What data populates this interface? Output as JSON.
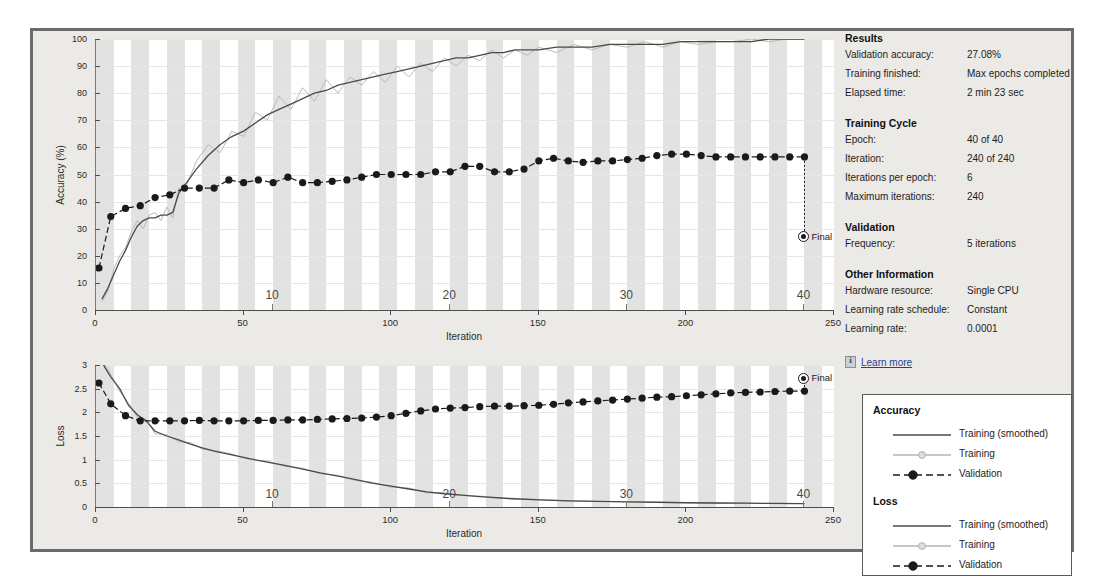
{
  "results": {
    "heading": "Results",
    "rows": [
      {
        "key": "Validation accuracy:",
        "value": "27.08%"
      },
      {
        "key": "Training finished:",
        "value": "Max epochs completed"
      },
      {
        "key": "Elapsed time:",
        "value": "2 min 23 sec"
      }
    ]
  },
  "training_cycle": {
    "heading": "Training Cycle",
    "rows": [
      {
        "key": "Epoch:",
        "value": "40 of 40"
      },
      {
        "key": "Iteration:",
        "value": "240 of 240"
      },
      {
        "key": "Iterations per epoch:",
        "value": "6"
      },
      {
        "key": "Maximum iterations:",
        "value": "240"
      }
    ]
  },
  "validation": {
    "heading": "Validation",
    "rows": [
      {
        "key": "Frequency:",
        "value": "5 iterations"
      }
    ]
  },
  "other_information": {
    "heading": "Other Information",
    "rows": [
      {
        "key": "Hardware resource:",
        "value": "Single CPU"
      },
      {
        "key": "Learning rate schedule:",
        "value": "Constant"
      },
      {
        "key": "Learning rate:",
        "value": "0.0001"
      }
    ]
  },
  "learn_more": {
    "label": "Learn more",
    "icon": "info-icon"
  },
  "legend": {
    "groups": [
      {
        "title": "Accuracy",
        "entries": [
          {
            "label": "Training (smoothed)",
            "style": "solid-dark"
          },
          {
            "label": "Training",
            "style": "solid-light-marker"
          },
          {
            "label": "Validation",
            "style": "dashed-dark-marker"
          }
        ]
      },
      {
        "title": "Loss",
        "entries": [
          {
            "label": "Training (smoothed)",
            "style": "solid-dark"
          },
          {
            "label": "Training",
            "style": "solid-light-marker"
          },
          {
            "label": "Validation",
            "style": "dashed-dark-marker"
          }
        ]
      }
    ]
  },
  "colors": {
    "smoothed": "#4a4a4a",
    "raw": "#b4b4b4",
    "validation": "#1a1a1a",
    "band": "#e2e2e2",
    "frame": "#6b6b6b",
    "panel_bg": "#eceae6",
    "link": "#25438c"
  },
  "chart_data": [
    {
      "type": "line",
      "id": "accuracy",
      "title": "",
      "xlabel": "Iteration",
      "ylabel": "Accuracy (%)",
      "xlim": [
        0,
        250
      ],
      "ylim": [
        0,
        100
      ],
      "xticks": [
        0,
        50,
        100,
        150,
        200,
        250
      ],
      "yticks": [
        0,
        10,
        20,
        30,
        40,
        50,
        60,
        70,
        80,
        90,
        100
      ],
      "epoch_ticks": [
        10,
        20,
        30,
        40
      ],
      "iterations_per_epoch": 6,
      "grid": true,
      "legend_position": "external-bottom-right",
      "final_point": {
        "x": 240,
        "y": 27.08,
        "label": "Final"
      },
      "series": [
        {
          "name": "Training (smoothed)",
          "style": "solid-dark",
          "x": [
            2,
            4,
            6,
            8,
            10,
            12,
            14,
            16,
            18,
            20,
            22,
            24,
            26,
            28,
            30,
            34,
            38,
            42,
            46,
            50,
            54,
            58,
            62,
            66,
            70,
            74,
            78,
            82,
            86,
            90,
            94,
            98,
            102,
            106,
            110,
            114,
            118,
            122,
            126,
            130,
            134,
            138,
            142,
            146,
            150,
            156,
            162,
            168,
            174,
            180,
            186,
            192,
            198,
            204,
            210,
            216,
            222,
            228,
            234,
            240
          ],
          "values": [
            4,
            8,
            13,
            18,
            22,
            27,
            31,
            33,
            34,
            34,
            35,
            35,
            36,
            43,
            46,
            52,
            57,
            61,
            64,
            66,
            69,
            72,
            74,
            76,
            78,
            80,
            81,
            83,
            84,
            85,
            86,
            87,
            88,
            89,
            90,
            91,
            92,
            93,
            93,
            94,
            95,
            95,
            96,
            96,
            96,
            97,
            97,
            97,
            98,
            98,
            98,
            98,
            99,
            99,
            99,
            99,
            99,
            100,
            100,
            100
          ]
        },
        {
          "name": "Training",
          "style": "solid-light",
          "x": [
            2,
            4,
            6,
            8,
            10,
            12,
            14,
            16,
            18,
            20,
            22,
            24,
            26,
            28,
            30,
            34,
            38,
            42,
            46,
            50,
            54,
            58,
            62,
            66,
            70,
            74,
            78,
            82,
            86,
            90,
            94,
            98,
            102,
            106,
            110,
            114,
            118,
            122,
            126,
            130,
            134,
            138,
            142,
            146,
            150,
            156,
            162,
            168,
            174,
            180,
            186,
            192,
            198,
            204,
            210,
            216,
            222,
            228,
            234,
            240
          ],
          "values": [
            3,
            7,
            15,
            20,
            23,
            29,
            33,
            30,
            35,
            36,
            33,
            38,
            34,
            45,
            44,
            55,
            61,
            58,
            66,
            64,
            73,
            70,
            79,
            74,
            82,
            77,
            85,
            80,
            86,
            83,
            88,
            84,
            90,
            86,
            91,
            88,
            93,
            90,
            94,
            92,
            96,
            93,
            96,
            94,
            97,
            95,
            98,
            96,
            98,
            97,
            99,
            97,
            99,
            98,
            99,
            99,
            100,
            99,
            100,
            100
          ]
        },
        {
          "name": "Validation",
          "style": "dashed-dark-marker",
          "x": [
            1,
            5,
            10,
            15,
            20,
            25,
            30,
            35,
            40,
            45,
            50,
            55,
            60,
            65,
            70,
            75,
            80,
            85,
            90,
            95,
            100,
            105,
            110,
            115,
            120,
            125,
            130,
            135,
            140,
            145,
            150,
            155,
            160,
            165,
            170,
            175,
            180,
            185,
            190,
            195,
            200,
            205,
            210,
            215,
            220,
            225,
            230,
            235,
            240
          ],
          "values": [
            15.5,
            34.5,
            37.5,
            38.5,
            41.5,
            42.5,
            45,
            45,
            45,
            48,
            47,
            48,
            47,
            49,
            47,
            47,
            47.5,
            48,
            49,
            50,
            50,
            50,
            50,
            51,
            51,
            53,
            53,
            51,
            51,
            52,
            55,
            56,
            55,
            54.5,
            55,
            55,
            55.5,
            56,
            57,
            57.5,
            57.5,
            57,
            56.5,
            56.5,
            56.5,
            56.5,
            56.5,
            56.5,
            56.5
          ]
        }
      ]
    },
    {
      "type": "line",
      "id": "loss",
      "title": "",
      "xlabel": "Iteration",
      "ylabel": "Loss",
      "xlim": [
        0,
        250
      ],
      "ylim": [
        0,
        3
      ],
      "xticks": [
        0,
        50,
        100,
        150,
        200,
        250
      ],
      "yticks": [
        0,
        0.5,
        1,
        1.5,
        2,
        2.5,
        3
      ],
      "epoch_ticks": [
        10,
        20,
        30,
        40
      ],
      "iterations_per_epoch": 6,
      "grid": true,
      "legend_position": "external-bottom-right",
      "final_point": {
        "x": 240,
        "y": 2.72,
        "label": "Final"
      },
      "series": [
        {
          "name": "Training (smoothed)",
          "style": "solid-dark",
          "x": [
            1,
            3,
            5,
            8,
            11,
            14,
            17,
            20,
            24,
            28,
            32,
            36,
            40,
            46,
            52,
            58,
            64,
            70,
            76,
            82,
            88,
            94,
            100,
            106,
            112,
            118,
            124,
            130,
            140,
            150,
            160,
            170,
            180,
            190,
            200,
            210,
            220,
            230,
            240
          ],
          "values": [
            3.2,
            2.95,
            2.75,
            2.5,
            2.15,
            1.95,
            1.82,
            1.6,
            1.5,
            1.42,
            1.33,
            1.25,
            1.18,
            1.1,
            1.02,
            0.95,
            0.88,
            0.8,
            0.72,
            0.65,
            0.58,
            0.5,
            0.44,
            0.38,
            0.32,
            0.28,
            0.25,
            0.22,
            0.18,
            0.15,
            0.13,
            0.12,
            0.11,
            0.1,
            0.09,
            0.085,
            0.08,
            0.075,
            0.07
          ]
        },
        {
          "name": "Training",
          "style": "solid-light",
          "x": [
            1,
            3,
            5,
            8,
            11,
            14,
            17,
            20,
            24,
            28,
            32,
            36,
            40,
            46,
            52,
            58,
            64,
            70,
            76,
            82,
            88,
            94,
            100,
            106,
            112,
            118,
            124,
            130,
            140,
            150,
            160,
            170,
            180,
            190,
            200,
            210,
            220,
            230,
            240
          ],
          "values": [
            3.3,
            3.0,
            2.8,
            2.45,
            2.2,
            1.9,
            1.85,
            1.55,
            1.52,
            1.38,
            1.36,
            1.22,
            1.2,
            1.12,
            1.0,
            0.97,
            0.86,
            0.82,
            0.7,
            0.67,
            0.56,
            0.52,
            0.42,
            0.4,
            0.3,
            0.3,
            0.24,
            0.23,
            0.17,
            0.16,
            0.13,
            0.12,
            0.11,
            0.1,
            0.09,
            0.08,
            0.08,
            0.07,
            0.07
          ]
        },
        {
          "name": "Validation",
          "style": "dashed-dark-marker",
          "x": [
            1,
            5,
            10,
            15,
            20,
            25,
            30,
            35,
            40,
            45,
            50,
            55,
            60,
            65,
            70,
            75,
            80,
            85,
            90,
            95,
            100,
            105,
            110,
            115,
            120,
            125,
            130,
            135,
            140,
            145,
            150,
            155,
            160,
            165,
            170,
            175,
            180,
            185,
            190,
            195,
            200,
            205,
            210,
            215,
            220,
            225,
            230,
            235,
            240
          ],
          "values": [
            2.62,
            2.18,
            1.93,
            1.82,
            1.82,
            1.82,
            1.82,
            1.83,
            1.82,
            1.82,
            1.82,
            1.83,
            1.83,
            1.84,
            1.84,
            1.85,
            1.86,
            1.87,
            1.88,
            1.9,
            1.93,
            1.98,
            2.03,
            2.07,
            2.09,
            2.1,
            2.12,
            2.13,
            2.13,
            2.14,
            2.15,
            2.17,
            2.2,
            2.22,
            2.24,
            2.26,
            2.28,
            2.3,
            2.32,
            2.33,
            2.35,
            2.37,
            2.39,
            2.41,
            2.42,
            2.43,
            2.44,
            2.45,
            2.45
          ]
        }
      ]
    }
  ]
}
